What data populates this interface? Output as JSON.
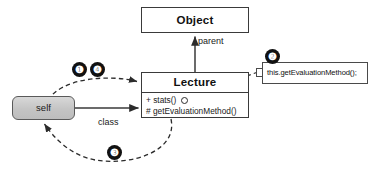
{
  "diagram": {
    "classes": [
      {
        "id": "object",
        "name": "Object",
        "members": []
      },
      {
        "id": "lecture",
        "name": "Lecture",
        "members": [
          {
            "visibility": "+",
            "signature": "stats()",
            "marker": "circle"
          },
          {
            "visibility": "#",
            "signature": "getEvaluationMethod()",
            "marker": "none"
          }
        ]
      }
    ],
    "nodes": [
      {
        "id": "self",
        "label": "self",
        "fill": "#c4c4c4",
        "stroke": "#5a5a5a"
      }
    ],
    "callout": {
      "id": "code-callout",
      "text": "this.getEvaluationMethod();"
    },
    "edges": [
      {
        "id": "parent-edge",
        "from": "Lecture",
        "to": "Object",
        "label": "parent",
        "style": "solid-arrow"
      },
      {
        "id": "class-edge",
        "from": "self",
        "to": "Lecture",
        "label": "class",
        "style": "solid-arrow"
      },
      {
        "id": "step-1-4-edge",
        "from": "self",
        "to": "Lecture",
        "label": "",
        "style": "dashed-arrow"
      },
      {
        "id": "step-2-edge",
        "from": "callout",
        "to": "stats()",
        "label": "",
        "style": "dashed"
      },
      {
        "id": "step-3-edge",
        "from": "Lecture",
        "to": "self",
        "label": "",
        "style": "dashed-arrow"
      }
    ],
    "badges": [
      {
        "id": "badge-1",
        "number": "❶"
      },
      {
        "id": "badge-2",
        "number": "❷"
      },
      {
        "id": "badge-3",
        "number": "❸"
      },
      {
        "id": "badge-4",
        "number": "❹"
      }
    ],
    "colors": {
      "box_stroke": "#3a3a3a",
      "node_fill": "#c4c4c4",
      "badge_fill": "#111111",
      "badge_text": "#ffffff",
      "background": "#ffffff"
    }
  }
}
